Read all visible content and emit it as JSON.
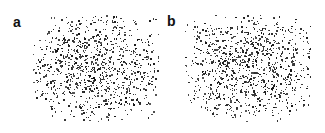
{
  "figure": {
    "background_color": "#ffffff",
    "width": 325,
    "height": 133,
    "speckle_color": "#1a1a1a",
    "panels": [
      {
        "id": "a",
        "label": "a",
        "label_x": 13,
        "label_y": 15,
        "field_x": 33,
        "field_y": 14,
        "field_width": 126,
        "field_height": 108,
        "point_count": 980,
        "seed": 1847
      },
      {
        "id": "b",
        "label": "b",
        "label_x": 167,
        "label_y": 14,
        "field_x": 185,
        "field_y": 14,
        "field_width": 126,
        "field_height": 108,
        "point_count": 1010,
        "seed": 9231
      }
    ]
  },
  "chart_data": {
    "type": "scatter",
    "title": "",
    "subtitle": "",
    "xlabel": "",
    "ylabel": "",
    "grid": false,
    "legend": null,
    "panels": [
      {
        "name": "a",
        "marker_color": "#1a1a1a",
        "marker_size_px": [
          1,
          2
        ],
        "n_points": 980,
        "xlim": [
          0,
          1
        ],
        "ylim": [
          0,
          1
        ],
        "density": "centre-weighted, fading at edges"
      },
      {
        "name": "b",
        "marker_color": "#1a1a1a",
        "marker_size_px": [
          1,
          2
        ],
        "n_points": 1010,
        "xlim": [
          0,
          1
        ],
        "ylim": [
          0,
          1
        ],
        "density": "centre-weighted, fading at edges"
      }
    ]
  }
}
